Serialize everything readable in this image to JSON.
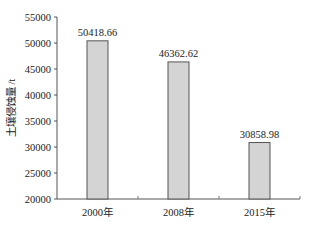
{
  "chart_data": {
    "type": "bar",
    "title": "",
    "xlabel": "",
    "ylabel": "土壤侵蚀量 /t",
    "categories": [
      "2000年",
      "2008年",
      "2015年"
    ],
    "values": [
      50418.66,
      46362.62,
      30858.98
    ],
    "value_labels": [
      "50418.66",
      "46362.62",
      "30858.98"
    ],
    "ylim": [
      20000,
      55000
    ],
    "yticks": [
      20000,
      25000,
      30000,
      35000,
      40000,
      45000,
      50000,
      55000
    ],
    "ytick_labels": [
      "20000",
      "25000",
      "30000",
      "35000",
      "40000",
      "45000",
      "50000",
      "55000"
    ],
    "grid": false,
    "legend": null,
    "bar_fill": "#d4d4d4",
    "bar_stroke": "#555555"
  }
}
